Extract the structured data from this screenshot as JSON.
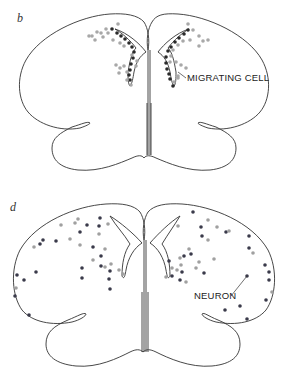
{
  "panels": [
    {
      "id": "b",
      "letter": "b",
      "label": "MIGRATING CELL",
      "dot_colors": {
        "dark": "#2a2a2a",
        "light": "#a8a8a8"
      },
      "dots": [
        [
          112,
          29,
          "d"
        ],
        [
          117,
          33,
          "d"
        ],
        [
          121,
          36,
          "d"
        ],
        [
          125,
          39,
          "d"
        ],
        [
          129,
          43,
          "d"
        ],
        [
          132,
          47,
          "d"
        ],
        [
          134,
          52,
          "d"
        ],
        [
          133,
          58,
          "d"
        ],
        [
          131,
          64,
          "d"
        ],
        [
          130,
          70,
          "d"
        ],
        [
          129,
          75,
          "d"
        ],
        [
          130,
          80,
          "d"
        ],
        [
          118,
          24,
          "l"
        ],
        [
          108,
          33,
          "l"
        ],
        [
          113,
          40,
          "l"
        ],
        [
          120,
          43,
          "l"
        ],
        [
          124,
          46,
          "l"
        ],
        [
          103,
          37,
          "l"
        ],
        [
          97,
          32,
          "l"
        ],
        [
          92,
          36,
          "l"
        ],
        [
          89,
          36,
          "l"
        ],
        [
          95,
          40,
          "l"
        ],
        [
          101,
          33,
          "l"
        ],
        [
          106,
          29,
          "l"
        ],
        [
          116,
          65,
          "l"
        ],
        [
          120,
          68,
          "l"
        ],
        [
          124,
          66,
          "l"
        ],
        [
          119,
          73,
          "l"
        ],
        [
          127,
          72,
          "l"
        ],
        [
          127,
          80,
          "l"
        ],
        [
          131,
          85,
          "l"
        ],
        [
          137,
          61,
          "l"
        ],
        [
          136,
          66,
          "l"
        ],
        [
          132,
          55,
          "l"
        ],
        [
          188,
          30,
          "d"
        ],
        [
          184,
          34,
          "d"
        ],
        [
          179,
          38,
          "d"
        ],
        [
          175,
          42,
          "d"
        ],
        [
          171,
          47,
          "d"
        ],
        [
          168,
          51,
          "d"
        ],
        [
          166,
          57,
          "d"
        ],
        [
          166,
          63,
          "d"
        ],
        [
          167,
          69,
          "d"
        ],
        [
          169,
          74,
          "d"
        ],
        [
          170,
          79,
          "d"
        ],
        [
          173,
          86,
          "d"
        ],
        [
          188,
          24,
          "l"
        ],
        [
          193,
          30,
          "l"
        ],
        [
          199,
          36,
          "l"
        ],
        [
          203,
          41,
          "l"
        ],
        [
          208,
          40,
          "l"
        ],
        [
          199,
          46,
          "l"
        ],
        [
          190,
          40,
          "l"
        ],
        [
          183,
          41,
          "l"
        ],
        [
          178,
          45,
          "l"
        ],
        [
          173,
          50,
          "l"
        ],
        [
          171,
          56,
          "l"
        ],
        [
          170,
          62,
          "l"
        ],
        [
          176,
          62,
          "l"
        ],
        [
          181,
          65,
          "l"
        ],
        [
          186,
          68,
          "l"
        ],
        [
          178,
          76,
          "l"
        ],
        [
          174,
          82,
          "l"
        ],
        [
          178,
          78,
          "l"
        ]
      ],
      "pointer": [
        [
          178,
          72
        ],
        [
          186,
          78
        ]
      ],
      "label_pos": [
        187,
        81
      ]
    },
    {
      "id": "d",
      "letter": "d",
      "label": "NEURON",
      "dot_colors": {
        "dark": "#3a3a4a",
        "light": "#a0a0a0"
      },
      "dots": [
        [
          100,
          218,
          "d"
        ],
        [
          99,
          226,
          "d"
        ],
        [
          87,
          225,
          "d"
        ],
        [
          80,
          232,
          "d"
        ],
        [
          43,
          240,
          "d"
        ],
        [
          40,
          244,
          "d"
        ],
        [
          56,
          241,
          "d"
        ],
        [
          93,
          247,
          "d"
        ],
        [
          101,
          256,
          "d"
        ],
        [
          82,
          268,
          "d"
        ],
        [
          101,
          266,
          "d"
        ],
        [
          110,
          271,
          "d"
        ],
        [
          82,
          278,
          "d"
        ],
        [
          109,
          279,
          "d"
        ],
        [
          110,
          289,
          "d"
        ],
        [
          36,
          272,
          "d"
        ],
        [
          17,
          275,
          "d"
        ],
        [
          24,
          280,
          "d"
        ],
        [
          15,
          296,
          "d"
        ],
        [
          29,
          315,
          "d"
        ],
        [
          61,
          225,
          "l"
        ],
        [
          75,
          223,
          "l"
        ],
        [
          78,
          219,
          "l"
        ],
        [
          108,
          224,
          "l"
        ],
        [
          99,
          234,
          "l"
        ],
        [
          34,
          247,
          "l"
        ],
        [
          70,
          239,
          "l"
        ],
        [
          80,
          245,
          "l"
        ],
        [
          105,
          249,
          "l"
        ],
        [
          93,
          260,
          "l"
        ],
        [
          105,
          267,
          "l"
        ],
        [
          111,
          264,
          "l"
        ],
        [
          119,
          270,
          "l"
        ],
        [
          123,
          274,
          "l"
        ],
        [
          16,
          288,
          "l"
        ],
        [
          193,
          212,
          "d"
        ],
        [
          201,
          227,
          "d"
        ],
        [
          202,
          236,
          "d"
        ],
        [
          226,
          232,
          "d"
        ],
        [
          249,
          236,
          "d"
        ],
        [
          169,
          261,
          "d"
        ],
        [
          184,
          256,
          "d"
        ],
        [
          191,
          254,
          "d"
        ],
        [
          172,
          276,
          "d"
        ],
        [
          182,
          272,
          "d"
        ],
        [
          180,
          280,
          "d"
        ],
        [
          204,
          273,
          "d"
        ],
        [
          249,
          248,
          "d"
        ],
        [
          247,
          276,
          "d"
        ],
        [
          265,
          265,
          "d"
        ],
        [
          269,
          272,
          "d"
        ],
        [
          269,
          280,
          "d"
        ],
        [
          266,
          300,
          "d"
        ],
        [
          225,
          310,
          "d"
        ],
        [
          240,
          306,
          "d"
        ],
        [
          247,
          319,
          "d"
        ],
        [
          178,
          226,
          "l"
        ],
        [
          208,
          220,
          "l"
        ],
        [
          217,
          227,
          "l"
        ],
        [
          208,
          240,
          "l"
        ],
        [
          189,
          249,
          "l"
        ],
        [
          180,
          258,
          "l"
        ],
        [
          177,
          270,
          "l"
        ],
        [
          172,
          268,
          "l"
        ],
        [
          181,
          265,
          "l"
        ],
        [
          199,
          262,
          "l"
        ],
        [
          214,
          259,
          "l"
        ],
        [
          186,
          282,
          "l"
        ],
        [
          166,
          277,
          "l"
        ],
        [
          229,
          231,
          "l"
        ],
        [
          253,
          253,
          "l"
        ],
        [
          272,
          292,
          "l"
        ],
        [
          196,
          268,
          "l"
        ]
      ],
      "pointer": [
        [
          231,
          296
        ],
        [
          247,
          276
        ]
      ],
      "label_pos": [
        194,
        299
      ]
    }
  ]
}
